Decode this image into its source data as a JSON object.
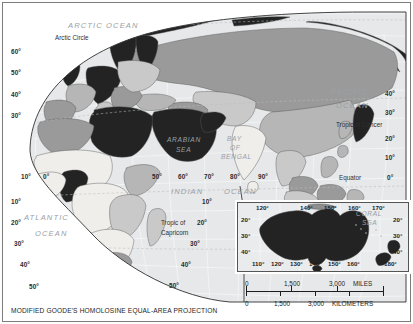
{
  "figure": {
    "caption": "MODIFIED GOODE'S HOMOLOSINE EQUAL-AREA PROJECTION",
    "projection": "Modified Goode's Homolosine Equal-Area",
    "region": "Eastern Hemisphere — Europe, Africa, Asia, Oceania"
  },
  "map": {
    "ocean_labels": [
      {
        "id": "arctic",
        "text": "ARCTIC  OCEAN"
      },
      {
        "id": "pacific_1",
        "text": "PACIFIC"
      },
      {
        "id": "pacific_2",
        "text": "OCEAN"
      },
      {
        "id": "atlantic_1",
        "text": "ATLANTIC"
      },
      {
        "id": "atlantic_2",
        "text": "OCEAN"
      },
      {
        "id": "indian_1",
        "text": "INDIAN"
      },
      {
        "id": "indian_2",
        "text": "OCEAN"
      },
      {
        "id": "arabian_1",
        "text": "ARABIAN"
      },
      {
        "id": "arabian_2",
        "text": "SEA"
      },
      {
        "id": "bengal_1",
        "text": "BAY"
      },
      {
        "id": "bengal_2",
        "text": "OF"
      },
      {
        "id": "bengal_3",
        "text": "BENGAL"
      }
    ],
    "reference_lines": [
      {
        "id": "arctic-circle",
        "text": "Arctic Circle"
      },
      {
        "id": "tropic-cancer",
        "text": "Tropic of Cancer"
      },
      {
        "id": "equator",
        "text": "Equator"
      },
      {
        "id": "tropic-capricorn-1",
        "text": "Tropic of"
      },
      {
        "id": "tropic-capricorn-2",
        "text": "Capricorn"
      }
    ],
    "latitude_left": [
      "60°",
      "50°",
      "40°",
      "30°",
      "10°",
      "20°",
      "30°",
      "40°",
      "50°"
    ],
    "latitude_right": [
      "40°",
      "30°",
      "20°",
      "10°",
      "0°",
      "10°",
      "20°",
      "30°",
      "40°",
      "50°"
    ],
    "longitude_labels": [
      "10°",
      "0°",
      "50°",
      "60°",
      "70°",
      "80°",
      "90°"
    ]
  },
  "inset": {
    "title": "Australia and New Zealand",
    "sea_label_1": "CORAL",
    "sea_label_2": "SEA",
    "longitude_top": [
      "120°",
      "140°",
      "150°",
      "160°",
      "170°"
    ],
    "longitude_bottom": [
      "110°",
      "120°",
      "130°",
      "140°",
      "150°",
      "160°",
      "180°"
    ],
    "latitude_left": [
      "20°",
      "30°",
      "40°"
    ],
    "latitude_right": [
      "20°",
      "30°",
      "40°"
    ]
  },
  "scale": {
    "miles_ticks": [
      "0",
      "1,500",
      "3,000"
    ],
    "miles_unit": "MILES",
    "km_ticks": [
      "0",
      "1,500",
      "3,000"
    ],
    "km_unit": "KILOMETERS"
  },
  "colors": {
    "highlight_dark": "#232323",
    "tier_mid": "#9a9a9a",
    "tier_light": "#c9c9c9",
    "tier_lightest": "#eceae6",
    "ocean_fill": "#e6e8ea",
    "border": "#6d6d6d"
  }
}
